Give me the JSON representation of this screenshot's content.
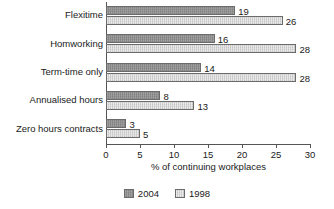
{
  "chart_data": {
    "type": "bar",
    "orientation": "horizontal",
    "title": "",
    "xlabel": "% of continuing workplaces",
    "ylabel": "",
    "xlim": [
      0,
      30
    ],
    "xticks": [
      0,
      5,
      10,
      15,
      20,
      25,
      30
    ],
    "grid": false,
    "legend_position": "bottom-center",
    "categories": [
      "Flexitime",
      "Homworking",
      "Term-time only",
      "Annualised hours",
      "Zero hours contracts"
    ],
    "series": [
      {
        "name": "2004",
        "color": "#8d8d8d",
        "values": [
          19,
          16,
          14,
          8,
          3
        ]
      },
      {
        "name": "1998",
        "color": "#d2d2d2",
        "values": [
          26,
          28,
          28,
          13,
          5
        ]
      }
    ]
  },
  "axis": {
    "x_title": "% of continuing workplaces",
    "tick_labels": [
      "0",
      "5",
      "10",
      "15",
      "20",
      "25",
      "30"
    ]
  },
  "legend": {
    "items": [
      {
        "label": "2004",
        "swatch": "legend-swatch-2004"
      },
      {
        "label": "1998",
        "swatch": "legend-swatch-1998"
      }
    ]
  }
}
